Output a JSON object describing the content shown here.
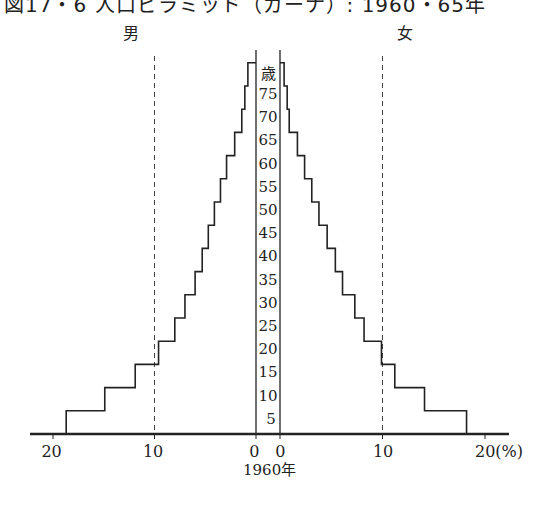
{
  "title": "図17・6 人口ピラミッド（ガーナ）: 1960・65年",
  "labels": {
    "male": "男",
    "female": "女",
    "age_unit": "歳",
    "year": "1960年",
    "percent_unit": "(%)"
  },
  "chart_data": {
    "type": "bar",
    "subtype": "population-pyramid",
    "title": "図17・6 人口ピラミッド（ガーナ）: 1960・65年",
    "year": "1960年",
    "xlabel": "(%)",
    "ylabel": "歳",
    "x_ticks_male": [
      "20",
      "10",
      "0"
    ],
    "x_ticks_female": [
      "0",
      "10",
      "20(%)"
    ],
    "xlim": [
      0,
      20
    ],
    "reference_lines_percent": [
      10
    ],
    "age_labels": [
      "5",
      "10",
      "15",
      "20",
      "25",
      "30",
      "35",
      "40",
      "45",
      "50",
      "55",
      "60",
      "65",
      "70",
      "75"
    ],
    "categories": [
      "0-4",
      "5-9",
      "10-14",
      "15-19",
      "20-24",
      "25-29",
      "30-34",
      "35-39",
      "40-44",
      "45-49",
      "50-54",
      "55-59",
      "60-64",
      "65-69",
      "70-74",
      "75+"
    ],
    "series": [
      {
        "name": "男",
        "values": [
          18.7,
          14.9,
          11.9,
          9.6,
          8.0,
          7.0,
          6.0,
          5.3,
          4.7,
          4.1,
          3.5,
          2.9,
          2.1,
          1.4,
          1.1,
          0.8
        ]
      },
      {
        "name": "女",
        "values": [
          18.2,
          14.1,
          11.2,
          9.9,
          8.2,
          7.3,
          6.1,
          5.4,
          4.6,
          3.8,
          3.1,
          2.4,
          1.7,
          0.9,
          0.7,
          0.4
        ]
      }
    ],
    "grid": false,
    "legend": "side labels above (男 left, 女 right)"
  }
}
